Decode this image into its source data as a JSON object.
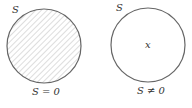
{
  "diagram": {
    "left": {
      "set_label": "S",
      "caption": "S = 0",
      "shaded": true,
      "circle": {
        "cx": 44,
        "cy": 46,
        "r": 37
      },
      "stroke_color": "#666666",
      "hatch_color": "#bbbbbb"
    },
    "right": {
      "set_label": "S",
      "caption": "S ≠ 0",
      "element_label": "x",
      "shaded": false,
      "circle": {
        "cx": 148,
        "cy": 45,
        "r": 37
      },
      "stroke_color": "#666666"
    }
  }
}
